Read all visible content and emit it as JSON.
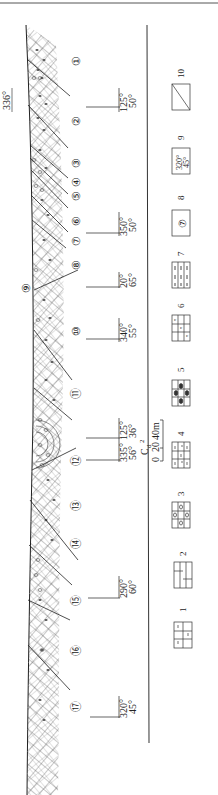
{
  "diagram": {
    "orientation": "rotated-90-clockwise",
    "strike_label": "336°",
    "layers": [
      {
        "id": 1,
        "label": "①",
        "y": 60
      },
      {
        "id": 2,
        "label": "②",
        "y": 120
      },
      {
        "id": 3,
        "label": "③",
        "y": 162
      },
      {
        "id": 4,
        "label": "④",
        "y": 181
      },
      {
        "id": 5,
        "label": "⑤",
        "y": 195
      },
      {
        "id": 6,
        "label": "⑥",
        "y": 220
      },
      {
        "id": 7,
        "label": "⑦",
        "y": 240
      },
      {
        "id": 8,
        "label": "⑧",
        "y": 264
      },
      {
        "id": 9,
        "label": "⑨",
        "y": 287
      },
      {
        "id": 10,
        "label": "⑩",
        "y": 330
      },
      {
        "id": 11,
        "label": "⑪",
        "y": 393
      },
      {
        "id": 12,
        "label": "⑫",
        "y": 460
      },
      {
        "id": 13,
        "label": "⑬",
        "y": 505
      },
      {
        "id": 14,
        "label": "⑭",
        "y": 543
      },
      {
        "id": 15,
        "label": "⑮",
        "y": 600
      },
      {
        "id": 16,
        "label": "⑯",
        "y": 650
      },
      {
        "id": 17,
        "label": "⑰",
        "y": 706
      }
    ],
    "attitudes": [
      {
        "azimuth": "125°",
        "dip": "50°",
        "y": 108
      },
      {
        "azimuth": "350°",
        "dip": "50°",
        "y": 233
      },
      {
        "azimuth": "20°",
        "dip": "65°",
        "y": 285
      },
      {
        "azimuth": "340°",
        "dip": "55°",
        "y": 338
      },
      {
        "azimuth": "335°",
        "dip": "56°",
        "y": 460
      },
      {
        "azimuth": "125°",
        "dip": "36°",
        "y": 437
      },
      {
        "azimuth": "290°",
        "dip": "60°",
        "y": 590
      },
      {
        "azimuth": "320°",
        "dip": "45°",
        "y": 714
      }
    ],
    "formation_label": "C",
    "formation_sub": "d",
    "formation_sup": "2",
    "scale": {
      "ticks": [
        "0",
        "20",
        "40m"
      ]
    }
  },
  "legend": {
    "items": [
      {
        "num": "1",
        "pattern": "limestone-brick"
      },
      {
        "num": "2",
        "pattern": "dolomite-brick"
      },
      {
        "num": "3",
        "pattern": "oolitic-limestone"
      },
      {
        "num": "4",
        "pattern": "siliceous-limestone"
      },
      {
        "num": "5",
        "pattern": "chert-nodule-limestone"
      },
      {
        "num": "6",
        "pattern": "argillaceous-limestone"
      },
      {
        "num": "7",
        "pattern": "shale"
      },
      {
        "num": "8",
        "pattern": "layer-number",
        "glyph": "⑦"
      },
      {
        "num": "9",
        "pattern": "attitude",
        "azimuth": "320°",
        "dip": "45°"
      },
      {
        "num": "10",
        "pattern": "fault"
      }
    ]
  }
}
